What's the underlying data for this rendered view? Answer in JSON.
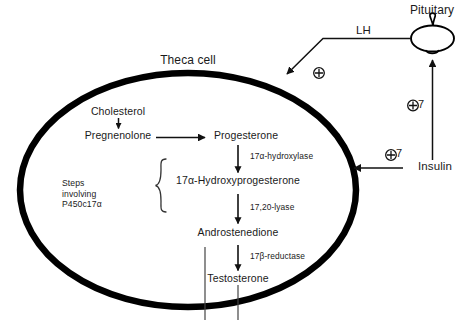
{
  "diagram": {
    "cell": {
      "label": "Theca cell",
      "shape": "ellipse",
      "stroke_color": "#000000"
    },
    "organ": {
      "label": "Pituitary",
      "shape": "pituitary-gland"
    },
    "hormones": {
      "lh": "LH",
      "insulin": "Insulin"
    },
    "metabolites": [
      {
        "id": "cholesterol",
        "label": "Cholesterol"
      },
      {
        "id": "pregnenolone",
        "label": "Pregnenolone"
      },
      {
        "id": "progesterone",
        "label": "Progesterone"
      },
      {
        "id": "hydroxyprogesterone",
        "label": "17α-Hydroxyprogesterone"
      },
      {
        "id": "androstenedione",
        "label": "Androstenedione"
      },
      {
        "id": "testosterone",
        "label": "Testosterone"
      }
    ],
    "enzymes": [
      {
        "id": "hydroxylase",
        "label": "17α-hydroxylase"
      },
      {
        "id": "lyase",
        "label": "17,20-lyase"
      },
      {
        "id": "reductase",
        "label": "17β-reductase"
      }
    ],
    "bracket": {
      "line1": "Steps",
      "line2": "involving",
      "line3": "P450c17α"
    },
    "annotations": [
      {
        "id": "lh-plus",
        "label": "⊕"
      },
      {
        "id": "insulin-pituitary-plus",
        "label": "⊕7"
      },
      {
        "id": "insulin-theca-plus",
        "label": "⊕7"
      }
    ]
  }
}
